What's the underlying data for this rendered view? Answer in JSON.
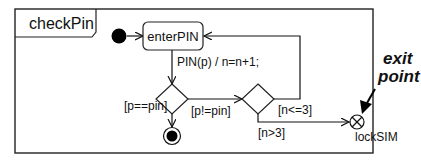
{
  "diagram": {
    "type": "UML state machine",
    "frame_name": "checkPin",
    "states": [
      {
        "id": "enterPIN",
        "label": "enterPIN"
      }
    ],
    "pseudostates": {
      "initial": "initial-node",
      "final": "final-node",
      "choice_1": "decision-pin",
      "choice_2": "decision-count",
      "exit_point": {
        "label": "lockSIM"
      }
    },
    "transitions": [
      {
        "from": "initial-node",
        "to": "enterPIN",
        "label": ""
      },
      {
        "from": "enterPIN",
        "to": "decision-pin",
        "label": "PIN(p) / n=n+1;"
      },
      {
        "from": "decision-pin",
        "to": "final-node",
        "label": "[p==pin]"
      },
      {
        "from": "decision-pin",
        "to": "decision-count",
        "label": "[p!=pin]"
      },
      {
        "from": "decision-count",
        "to": "enterPIN",
        "label": "[n<=3]"
      },
      {
        "from": "decision-count",
        "to": "lockSIM",
        "label": "[n>3]"
      }
    ],
    "annotation": {
      "line1": "exit",
      "line2": "point"
    }
  }
}
